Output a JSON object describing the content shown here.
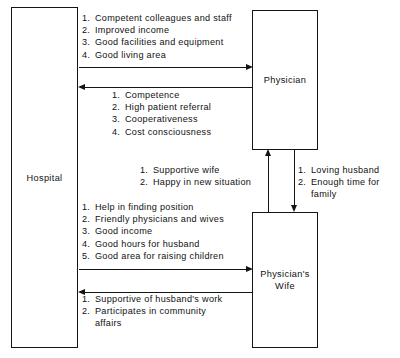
{
  "diagram": {
    "nodes": {
      "hospital": "Hospital",
      "physician": "Physician",
      "wife": "Physician's Wife"
    },
    "flows": {
      "hospital_to_physician": {
        "from": "Hospital",
        "to": "Physician",
        "direction": "right",
        "items": [
          {
            "num": "1.",
            "text": "Competent colleagues and staff"
          },
          {
            "num": "2.",
            "text": "Improved income"
          },
          {
            "num": "3.",
            "text": "Good facilities and equipment"
          },
          {
            "num": "4.",
            "text": "Good living area"
          }
        ]
      },
      "physician_to_hospital": {
        "from": "Physician",
        "to": "Hospital",
        "direction": "left",
        "items": [
          {
            "num": "1.",
            "text": "Competence"
          },
          {
            "num": "2.",
            "text": "High patient referral"
          },
          {
            "num": "3.",
            "text": "Cooperativeness"
          },
          {
            "num": "4.",
            "text": "Cost consciousness"
          }
        ]
      },
      "wife_to_physician": {
        "from": "Physician's Wife",
        "to": "Physician",
        "direction": "up",
        "items": [
          {
            "num": "1.",
            "text": "Supportive wife"
          },
          {
            "num": "2.",
            "text": "Happy in new situation"
          }
        ]
      },
      "physician_to_wife": {
        "from": "Physician",
        "to": "Physician's Wife",
        "direction": "down",
        "items": [
          {
            "num": "1.",
            "text": "Loving husband"
          },
          {
            "num": "2.",
            "text": "Enough time for"
          },
          {
            "num": "",
            "text": "family"
          }
        ]
      },
      "hospital_to_wife": {
        "from": "Hospital",
        "to": "Physician's Wife",
        "direction": "right",
        "items": [
          {
            "num": "1.",
            "text": "Help in finding position"
          },
          {
            "num": "2.",
            "text": "Friendly physicians and wives"
          },
          {
            "num": "3.",
            "text": "Good income"
          },
          {
            "num": "4.",
            "text": "Good hours for husband"
          },
          {
            "num": "5.",
            "text": "Good area for raising children"
          }
        ]
      },
      "wife_to_hospital": {
        "from": "Physician's Wife",
        "to": "Hospital",
        "direction": "left",
        "items": [
          {
            "num": "1.",
            "text": "Supportive of husband's work"
          },
          {
            "num": "2.",
            "text": "Participates in community"
          },
          {
            "num": "",
            "text": "affairs"
          }
        ]
      }
    },
    "colors": {
      "stroke": "#141414",
      "text": "#111111",
      "background": "#ffffff"
    }
  }
}
